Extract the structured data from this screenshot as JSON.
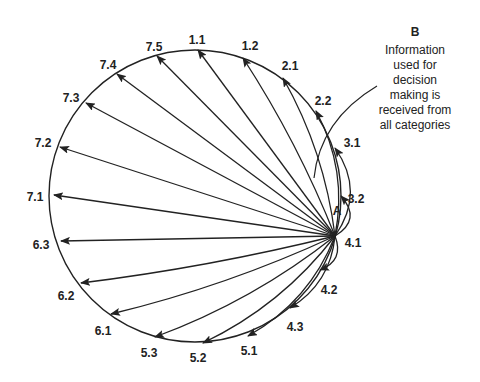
{
  "diagram": {
    "circle": {
      "cx": 195,
      "cy": 196,
      "r": 146,
      "stroke": "#222222"
    },
    "source": {
      "id": "4.1",
      "x": 335,
      "y": 236
    },
    "source_marker_label": "A",
    "annotation": {
      "heading": "B",
      "lines": [
        "Information",
        "used for",
        "decision",
        "making is",
        "received from",
        "all categories"
      ]
    },
    "nodes": [
      {
        "id": "1.1",
        "label": "1.1",
        "tx": 197,
        "ty": 41,
        "ax": 198,
        "ay": 50,
        "curve": 0
      },
      {
        "id": "1.2",
        "label": "1.2",
        "tx": 250,
        "ty": 47,
        "ax": 243,
        "ay": 58,
        "curve": 0.05
      },
      {
        "id": "2.1",
        "label": "2.1",
        "tx": 290,
        "ty": 67,
        "ax": 283,
        "ay": 78,
        "curve": 0.1
      },
      {
        "id": "2.2",
        "label": "2.2",
        "tx": 323,
        "ty": 102,
        "ax": 316,
        "ay": 111,
        "curve": 0.18
      },
      {
        "id": "3.1",
        "label": "3.1",
        "tx": 352,
        "ty": 144,
        "ax": 335,
        "ay": 148,
        "curve": 0.35
      },
      {
        "id": "3.2",
        "label": "3.2",
        "tx": 356,
        "ty": 200,
        "ax": 341,
        "ay": 196,
        "curve": 0.6
      },
      {
        "id": "4.2",
        "label": "4.2",
        "tx": 329,
        "ty": 291,
        "ax": 320,
        "ay": 270,
        "curve": -0.5
      },
      {
        "id": "4.3",
        "label": "4.3",
        "tx": 295,
        "ty": 328,
        "ax": 290,
        "ay": 308,
        "curve": -0.25
      },
      {
        "id": "5.1",
        "label": "5.1",
        "tx": 249,
        "ty": 352,
        "ax": 248,
        "ay": 336,
        "curve": -0.18
      },
      {
        "id": "5.2",
        "label": "5.2",
        "tx": 198,
        "ty": 359,
        "ax": 203,
        "ay": 343,
        "curve": -0.12
      },
      {
        "id": "5.3",
        "label": "5.3",
        "tx": 149,
        "ty": 354,
        "ax": 155,
        "ay": 337,
        "curve": -0.08
      },
      {
        "id": "6.1",
        "label": "6.1",
        "tx": 103,
        "ty": 332,
        "ax": 111,
        "ay": 314,
        "curve": -0.05
      },
      {
        "id": "6.2",
        "label": "6.2",
        "tx": 66,
        "ty": 297,
        "ax": 81,
        "ay": 283,
        "curve": -0.03
      },
      {
        "id": "6.3",
        "label": "6.3",
        "tx": 41,
        "ty": 246,
        "ax": 61,
        "ay": 241,
        "curve": 0
      },
      {
        "id": "7.1",
        "label": "7.1",
        "tx": 35,
        "ty": 198,
        "ax": 54,
        "ay": 195,
        "curve": 0
      },
      {
        "id": "7.2",
        "label": "7.2",
        "tx": 43,
        "ty": 144,
        "ax": 60,
        "ay": 147,
        "curve": 0
      },
      {
        "id": "7.3",
        "label": "7.3",
        "tx": 71,
        "ty": 99,
        "ax": 86,
        "ay": 103,
        "curve": 0
      },
      {
        "id": "7.4",
        "label": "7.4",
        "tx": 108,
        "ty": 66,
        "ax": 117,
        "ay": 74,
        "curve": 0
      },
      {
        "id": "7.5",
        "label": "7.5",
        "tx": 154,
        "ty": 48,
        "ax": 157,
        "ay": 56,
        "curve": 0
      }
    ]
  }
}
